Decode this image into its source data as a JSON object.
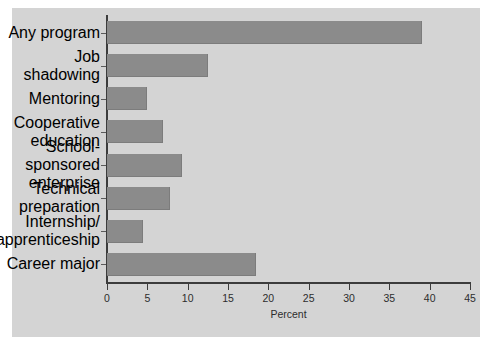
{
  "chart_data": {
    "type": "bar",
    "orientation": "horizontal",
    "title": "",
    "xlabel": "Percent",
    "ylabel": "",
    "xlim": [
      0,
      45
    ],
    "xticks": [
      0,
      5,
      10,
      15,
      20,
      25,
      30,
      35,
      40,
      45
    ],
    "grid": false,
    "legend": null,
    "categories": [
      "Any program",
      "Job shadowing",
      "Mentoring",
      "Cooperative education",
      "School-sponsored enterprise",
      "Technical preparation",
      "Internship/ apprenticeship",
      "Career major"
    ],
    "category_labels_wrapped": [
      [
        "Any program"
      ],
      [
        "Job shadowing"
      ],
      [
        "Mentoring"
      ],
      [
        "Cooperative",
        "education"
      ],
      [
        "School-sponsored",
        "enterprise"
      ],
      [
        "Technical",
        "preparation"
      ],
      [
        "Internship/",
        "apprenticeship"
      ],
      [
        "Career major"
      ]
    ],
    "values": [
      39,
      12.5,
      5,
      7,
      9.3,
      7.8,
      4.5,
      18.5
    ],
    "bar_color": "#8b8b8b",
    "panel_color": "#d4d4d4",
    "axis_color": "#3c3c3c",
    "text_color": "#2d2d2d"
  },
  "axis": {
    "x_title": "Percent",
    "tick_labels": [
      "0",
      "5",
      "10",
      "15",
      "20",
      "25",
      "30",
      "35",
      "40",
      "45"
    ]
  }
}
